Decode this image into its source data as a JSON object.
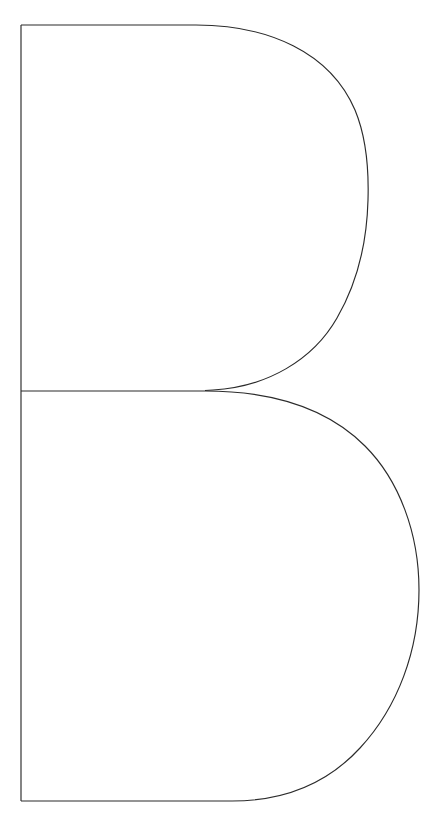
{
  "page": {
    "background_color": "#ffffff",
    "width": 441,
    "height": 828
  },
  "artwork": {
    "name": "uppercase-letter-b-outline",
    "character": "B",
    "description": "Outline drawing of the uppercase letter B",
    "style": "line-art outline, unfilled",
    "stroke_color": "#2b2b2b",
    "fill_color": "none",
    "stroke_width_px": 1,
    "parts": [
      {
        "name": "left-stem",
        "label": "Vertical stem",
        "from_x": 21,
        "from_y": 25,
        "to_x": 21,
        "to_y": 801
      },
      {
        "name": "top-horizontal",
        "label": "Top horizontal edge",
        "from_x": 21,
        "from_y": 25,
        "to_x": 196,
        "to_y": 25
      },
      {
        "name": "waist-horizontal",
        "label": "Middle waist line",
        "from_x": 21,
        "from_y": 390,
        "to_x": 205,
        "to_y": 390
      },
      {
        "name": "bottom-horizontal",
        "label": "Bottom horizontal edge",
        "from_x": 21,
        "from_y": 801,
        "to_x": 232,
        "to_y": 801
      },
      {
        "name": "upper-bowl",
        "label": "Upper bowl arc",
        "rightmost_x": 368,
        "top_y": 25,
        "bottom_y": 391
      },
      {
        "name": "lower-bowl",
        "label": "Lower bowl arc",
        "rightmost_x": 419,
        "top_y": 391,
        "bottom_y": 801
      }
    ]
  }
}
